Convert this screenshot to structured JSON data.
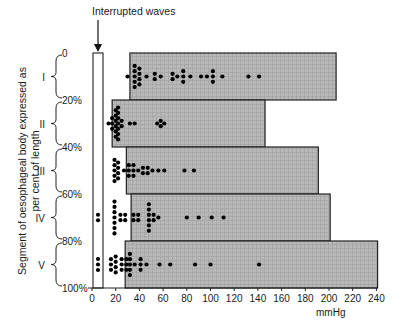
{
  "chart_data": {
    "type": "scatter",
    "title": "",
    "annotation": "Interrupted waves",
    "xlabel": "mmHg",
    "ylabel": "Segment of oesophageal body expressed as per cent of length",
    "xlim": [
      0,
      240
    ],
    "x_ticks": [
      0,
      20,
      40,
      60,
      80,
      100,
      120,
      140,
      160,
      180,
      200,
      220,
      240
    ],
    "y_ticks": [
      "0",
      "20%",
      "40%",
      "60%",
      "80%",
      "100%"
    ],
    "grid": false,
    "segments": [
      {
        "name": "I",
        "range_pct": [
          0,
          20
        ],
        "box_range_mmHg": [
          32,
          206
        ],
        "interrupted_waves": 0,
        "points_mmHg": [
          {
            "x": 30,
            "n": 1
          },
          {
            "x": 36,
            "n": 5
          },
          {
            "x": 40,
            "n": 4
          },
          {
            "x": 46,
            "n": 1
          },
          {
            "x": 53,
            "n": 2
          },
          {
            "x": 58,
            "n": 1
          },
          {
            "x": 68,
            "n": 2
          },
          {
            "x": 72,
            "n": 1
          },
          {
            "x": 77,
            "n": 3
          },
          {
            "x": 83,
            "n": 1
          },
          {
            "x": 92,
            "n": 1
          },
          {
            "x": 97,
            "n": 1
          },
          {
            "x": 102,
            "n": 3
          },
          {
            "x": 110,
            "n": 1
          },
          {
            "x": 132,
            "n": 1
          },
          {
            "x": 141,
            "n": 1
          }
        ]
      },
      {
        "name": "II",
        "range_pct": [
          20,
          40
        ],
        "box_range_mmHg": [
          17,
          146
        ],
        "interrupted_waves": 0,
        "points_mmHg": [
          {
            "x": 14,
            "n": 1
          },
          {
            "x": 17,
            "n": 3
          },
          {
            "x": 20,
            "n": 6
          },
          {
            "x": 22,
            "n": 7
          },
          {
            "x": 25,
            "n": 2
          },
          {
            "x": 32,
            "n": 1
          },
          {
            "x": 36,
            "n": 1
          },
          {
            "x": 55,
            "n": 1
          },
          {
            "x": 58,
            "n": 2
          },
          {
            "x": 61,
            "n": 1
          }
        ]
      },
      {
        "name": "III",
        "range_pct": [
          40,
          60
        ],
        "box_range_mmHg": [
          29,
          191
        ],
        "interrupted_waves": 0,
        "points_mmHg": [
          {
            "x": 19,
            "n": 5
          },
          {
            "x": 22,
            "n": 4
          },
          {
            "x": 27,
            "n": 1
          },
          {
            "x": 31,
            "n": 3
          },
          {
            "x": 35,
            "n": 3
          },
          {
            "x": 39,
            "n": 1
          },
          {
            "x": 43,
            "n": 2
          },
          {
            "x": 47,
            "n": 2
          },
          {
            "x": 51,
            "n": 1
          },
          {
            "x": 56,
            "n": 1
          },
          {
            "x": 61,
            "n": 1
          },
          {
            "x": 78,
            "n": 1
          },
          {
            "x": 86,
            "n": 1
          }
        ]
      },
      {
        "name": "IV",
        "range_pct": [
          60,
          80
        ],
        "box_range_mmHg": [
          33,
          201
        ],
        "interrupted_waves": 2,
        "points_mmHg": [
          {
            "x": 19,
            "n": 7
          },
          {
            "x": 24,
            "n": 2
          },
          {
            "x": 28,
            "n": 2
          },
          {
            "x": 35,
            "n": 2
          },
          {
            "x": 39,
            "n": 2
          },
          {
            "x": 48,
            "n": 6
          },
          {
            "x": 52,
            "n": 2
          },
          {
            "x": 56,
            "n": 1
          },
          {
            "x": 80,
            "n": 1
          },
          {
            "x": 90,
            "n": 1
          },
          {
            "x": 101,
            "n": 1
          },
          {
            "x": 111,
            "n": 1
          }
        ]
      },
      {
        "name": "V",
        "range_pct": [
          80,
          100
        ],
        "box_range_mmHg": [
          28,
          241
        ],
        "interrupted_waves": 3,
        "points_mmHg": [
          {
            "x": 16,
            "n": 3
          },
          {
            "x": 20,
            "n": 4
          },
          {
            "x": 25,
            "n": 3
          },
          {
            "x": 29,
            "n": 3
          },
          {
            "x": 32,
            "n": 5
          },
          {
            "x": 36,
            "n": 1
          },
          {
            "x": 41,
            "n": 3
          },
          {
            "x": 46,
            "n": 1
          },
          {
            "x": 57,
            "n": 1
          },
          {
            "x": 66,
            "n": 1
          },
          {
            "x": 87,
            "n": 1
          },
          {
            "x": 100,
            "n": 1
          },
          {
            "x": 141,
            "n": 1
          }
        ]
      }
    ]
  },
  "colors": {
    "box_fill": "#b3b3b3",
    "box_stroke": "#222222",
    "dot": "#000000",
    "text": "#1a1a1a"
  }
}
